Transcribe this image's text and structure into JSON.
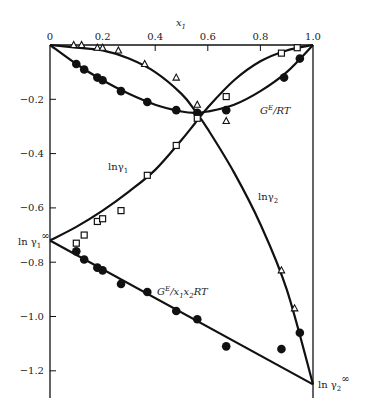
{
  "chart_data": {
    "type": "line",
    "title": "",
    "xlabel": "x1",
    "ylabel": "",
    "xlim": [
      0,
      1.0
    ],
    "ylim": [
      -1.3,
      0
    ],
    "x_ticks": [
      "0",
      "0.2",
      "0.4",
      "0.6",
      "0.8",
      "1.0"
    ],
    "y_ticks": [
      "-0.2",
      "-0.4",
      "-0.6",
      "-0.8",
      "-1.0",
      "-1.2"
    ],
    "grid": false,
    "annotations": {
      "ge_rt": "G^E/RT",
      "ln_gamma1": "lnγ1",
      "ln_gamma2": "lnγ2",
      "ge_x1x2rt": "G^E/x1x2RT",
      "ln_gamma1_inf": "ln γ1∞",
      "ln_gamma2_inf": "ln γ2∞"
    },
    "series": [
      {
        "name": "G^E/RT (data)",
        "marker": "filled-circle",
        "x": [
          0.1,
          0.13,
          0.18,
          0.2,
          0.27,
          0.37,
          0.48,
          0.56,
          0.67,
          0.89,
          0.95
        ],
        "y": [
          -0.07,
          -0.09,
          -0.12,
          -0.13,
          -0.17,
          -0.21,
          -0.24,
          -0.25,
          -0.24,
          -0.12,
          -0.05
        ]
      },
      {
        "name": "ln γ1 (data)",
        "marker": "open-square",
        "x": [
          0.1,
          0.13,
          0.18,
          0.2,
          0.27,
          0.37,
          0.48,
          0.56,
          0.67,
          0.88,
          0.94
        ],
        "y": [
          -0.73,
          -0.7,
          -0.65,
          -0.64,
          -0.61,
          -0.48,
          -0.37,
          -0.27,
          -0.19,
          -0.03,
          -0.01
        ]
      },
      {
        "name": "ln γ2 (data)",
        "marker": "open-triangle",
        "x": [
          0.09,
          0.12,
          0.18,
          0.2,
          0.26,
          0.36,
          0.48,
          0.56,
          0.67,
          0.88,
          0.93
        ],
        "y": [
          0.0,
          0.0,
          -0.01,
          -0.01,
          -0.02,
          -0.07,
          -0.12,
          -0.22,
          -0.28,
          -0.83,
          -0.97
        ]
      },
      {
        "name": "G^E/x1x2RT (data)",
        "marker": "filled-circle",
        "x": [
          0.1,
          0.13,
          0.18,
          0.2,
          0.27,
          0.37,
          0.48,
          0.56,
          0.67,
          0.88,
          0.95
        ],
        "y": [
          -0.76,
          -0.79,
          -0.82,
          -0.83,
          -0.88,
          -0.91,
          -0.98,
          -1.01,
          -1.11,
          -1.12,
          -1.06
        ]
      },
      {
        "name": "G^E/RT (fit)",
        "marker": "none",
        "x": [
          0,
          0.1,
          0.2,
          0.3,
          0.4,
          0.5,
          0.55,
          0.6,
          0.7,
          0.8,
          0.9,
          1.0
        ],
        "y": [
          0,
          -0.07,
          -0.13,
          -0.18,
          -0.22,
          -0.245,
          -0.25,
          -0.245,
          -0.22,
          -0.17,
          -0.1,
          0
        ]
      },
      {
        "name": "ln γ1 (fit)",
        "marker": "none",
        "x": [
          0,
          0.1,
          0.2,
          0.3,
          0.4,
          0.5,
          0.55,
          0.6,
          0.7,
          0.8,
          0.9,
          1.0
        ],
        "y": [
          -0.72,
          -0.67,
          -0.61,
          -0.54,
          -0.46,
          -0.35,
          -0.29,
          -0.23,
          -0.13,
          -0.06,
          -0.02,
          0
        ]
      },
      {
        "name": "ln γ2 (fit)",
        "marker": "none",
        "x": [
          0,
          0.1,
          0.2,
          0.3,
          0.4,
          0.5,
          0.55,
          0.6,
          0.7,
          0.8,
          0.9,
          1.0
        ],
        "y": [
          0,
          -0.01,
          -0.02,
          -0.05,
          -0.1,
          -0.18,
          -0.24,
          -0.31,
          -0.47,
          -0.66,
          -0.9,
          -1.25
        ]
      },
      {
        "name": "G^E/x1x2RT (fit)",
        "marker": "none",
        "x": [
          0,
          1.0
        ],
        "y": [
          -0.72,
          -1.25
        ]
      }
    ]
  }
}
